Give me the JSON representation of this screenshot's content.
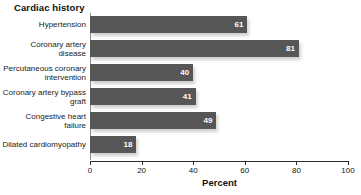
{
  "chart_data": {
    "type": "bar",
    "orientation": "horizontal",
    "title": "Cardiac history",
    "xlabel": "Percent",
    "ylabel": "",
    "xlim": [
      0,
      100
    ],
    "xticks": [
      0,
      20,
      40,
      60,
      80,
      100
    ],
    "grid": false,
    "legend": null,
    "bar_color": "#565656",
    "value_label_color": "#ffffff",
    "categories": [
      "Hypertension",
      "Coronary artery disease",
      "Percutaneous coronary intervention",
      "Coronary artery bypass graft",
      "Congestive heart failure",
      "Dilated cardiomyopathy"
    ],
    "values": [
      61,
      81,
      40,
      41,
      49,
      18
    ]
  }
}
